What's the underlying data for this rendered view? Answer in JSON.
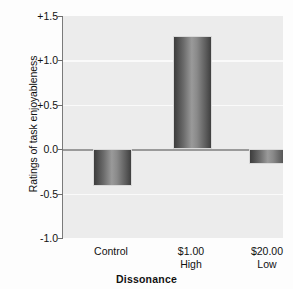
{
  "chart_data": {
    "type": "bar",
    "title": "",
    "xlabel": "Dissonance",
    "ylabel": "Ratings of task enjoyableness",
    "categories": [
      "Control",
      "$1.00\nHigh",
      "$20.00\nLow"
    ],
    "category_lines": [
      {
        "line1": "Control",
        "line2": ""
      },
      {
        "line1": "$1.00",
        "line2": "High"
      },
      {
        "line1": "$20.00",
        "line2": "Low"
      }
    ],
    "values": [
      -0.41,
      1.27,
      -0.17
    ],
    "ylim": [
      -1.0,
      1.5
    ],
    "ytick_values": [
      1.5,
      1.0,
      0.5,
      0.0,
      -0.5,
      -1.0
    ],
    "ytick_labels": [
      "+1.5",
      "+1.0",
      "+0.5",
      "0.0",
      "-0.5",
      "-1.0"
    ],
    "grid": true,
    "legend": "none",
    "plot_background": "#ececec",
    "bar_color_dark": "#3d3d3d",
    "bar_color_light": "#9a9a9a",
    "gridline_color": "#fafafa",
    "zeroline_color": "#9a9a9a"
  }
}
